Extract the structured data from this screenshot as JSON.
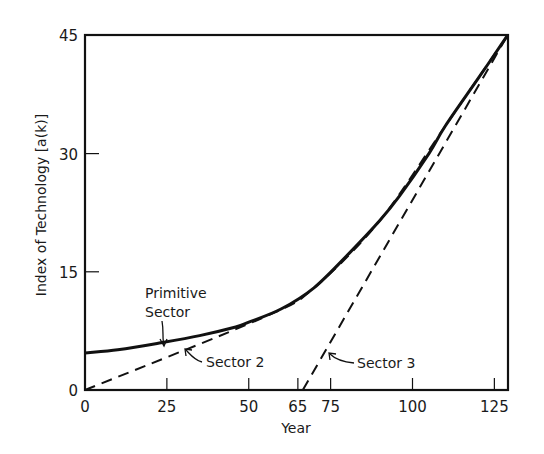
{
  "chart_data": {
    "type": "line",
    "title": "",
    "xlabel": "Year",
    "ylabel": "Index of Technology [a(k)]",
    "xlim": [
      0,
      129
    ],
    "ylim": [
      0,
      45
    ],
    "grid": false,
    "legend": null,
    "x_ticks": [
      {
        "value": 0,
        "label": "0"
      },
      {
        "value": 25,
        "label": "25"
      },
      {
        "value": 50,
        "label": "50"
      },
      {
        "value": 65,
        "label": "65"
      },
      {
        "value": 75,
        "label": "75"
      },
      {
        "value": 100,
        "label": "100"
      },
      {
        "value": 125,
        "label": "125"
      }
    ],
    "y_ticks": [
      {
        "value": 0,
        "label": "0"
      },
      {
        "value": 15,
        "label": "15"
      },
      {
        "value": 30,
        "label": "30"
      },
      {
        "value": 45,
        "label": "45"
      }
    ],
    "series": [
      {
        "name": "Primitive Sector",
        "style": "solid",
        "points": [
          [
            0,
            4.7
          ],
          [
            10,
            5.1
          ],
          [
            22,
            5.9
          ],
          [
            35,
            6.9
          ],
          [
            46,
            8.0
          ],
          [
            50,
            8.6
          ],
          [
            60,
            10.3
          ],
          [
            70,
            13.0
          ],
          [
            81,
            17.5
          ],
          [
            90,
            21.5
          ],
          [
            96,
            24.6
          ],
          [
            105,
            30.0
          ],
          [
            110,
            33.5
          ],
          [
            120,
            39.5
          ],
          [
            129,
            45.0
          ]
        ]
      },
      {
        "name": "Sector 2",
        "style": "dashed",
        "points": [
          [
            0,
            0
          ],
          [
            55,
            9.3
          ],
          [
            70,
            13.0
          ],
          [
            90,
            21.5
          ],
          [
            110,
            33.5
          ],
          [
            129,
            45.0
          ]
        ]
      },
      {
        "name": "Sector 3",
        "style": "dashed",
        "points": [
          [
            66.5,
            0
          ],
          [
            129,
            45.0
          ]
        ]
      }
    ],
    "annotations": [
      {
        "text_lines": [
          "Primitive",
          "Sector"
        ],
        "points_to": [
          28,
          6.2
        ]
      },
      {
        "text_lines": [
          "Sector 2"
        ],
        "points_to": [
          33,
          5.5
        ]
      },
      {
        "text_lines": [
          "Sector 3"
        ],
        "points_to": [
          71,
          3.8
        ]
      }
    ]
  },
  "labels": {
    "xlabel": "Year",
    "ylabel": "Index of Technology [a(k)]",
    "primitive_line1": "Primitive",
    "primitive_line2": "Sector",
    "sector2": "Sector 2",
    "sector3": "Sector 3"
  }
}
